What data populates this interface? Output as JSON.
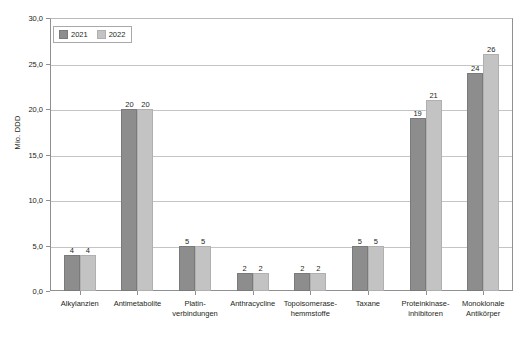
{
  "chart_data": {
    "type": "bar",
    "title": "",
    "subtitle": "",
    "xlabel": "",
    "ylabel": "Mio. DDD",
    "ylim": [
      0,
      30
    ],
    "ytick_labels": [
      "0,0",
      "5,0",
      "10,0",
      "15,0",
      "20,0",
      "25,0",
      "30,0"
    ],
    "ytick_values": [
      0,
      5,
      10,
      15,
      20,
      25,
      30
    ],
    "grid": true,
    "legend_position": "top-left",
    "categories": [
      "Alkylanzien",
      "Antimetabolite",
      "Platin-\nverbindungen",
      "Anthracycline",
      "Topoisomerase-\nhemmstoffe",
      "Taxane",
      "Proteinkinase-\ninhibitoren",
      "Monoklonale\nAntikörper"
    ],
    "series": [
      {
        "name": "2021",
        "color": "#8d8d8d",
        "values": [
          4,
          20,
          5,
          2,
          2,
          5,
          19,
          24
        ],
        "value_labels": [
          "4",
          "20",
          "5",
          "2",
          "2",
          "5",
          "19",
          "24"
        ]
      },
      {
        "name": "2022",
        "color": "#c3c3c3",
        "values": [
          4,
          20,
          5,
          2,
          2,
          5,
          21,
          26
        ],
        "value_labels": [
          "4",
          "20",
          "5",
          "2",
          "2",
          "5",
          "21",
          "26"
        ]
      }
    ]
  },
  "legend": {
    "items": [
      {
        "label": "2021"
      },
      {
        "label": "2022"
      }
    ]
  },
  "axis": {
    "y_title": "Mio. DDD"
  },
  "categories_display": [
    {
      "line1": "Alkylanzien",
      "line2": ""
    },
    {
      "line1": "Antimetabolite",
      "line2": ""
    },
    {
      "line1": "Platin-",
      "line2": "verbindungen"
    },
    {
      "line1": "Anthracycline",
      "line2": ""
    },
    {
      "line1": "Topoisomerase-",
      "line2": "hemmstoffe"
    },
    {
      "line1": "Taxane",
      "line2": ""
    },
    {
      "line1": "Proteinkinase-",
      "line2": "inhibitoren"
    },
    {
      "line1": "Monoklonale",
      "line2": "Antikörper"
    }
  ],
  "ytick_display": [
    {
      "label": "30,0"
    },
    {
      "label": "25,0"
    },
    {
      "label": "20,0"
    },
    {
      "label": "15,0"
    },
    {
      "label": "10,0"
    },
    {
      "label": "5,0"
    },
    {
      "label": "0,0"
    }
  ],
  "bar_values_display": [
    {
      "v2021": "4",
      "v2022": "4"
    },
    {
      "v2021": "20",
      "v2022": "20"
    },
    {
      "v2021": "5",
      "v2022": "5"
    },
    {
      "v2021": "2",
      "v2022": "2"
    },
    {
      "v2021": "2",
      "v2022": "2"
    },
    {
      "v2021": "5",
      "v2022": "5"
    },
    {
      "v2021": "19",
      "v2022": "21"
    },
    {
      "v2021": "24",
      "v2022": "26"
    }
  ]
}
